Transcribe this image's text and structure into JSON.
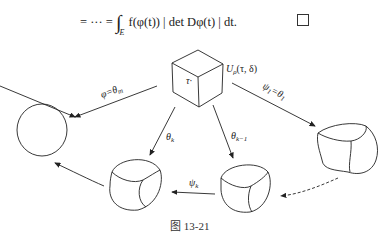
{
  "equation": {
    "lhs": "= ··· =",
    "integral_symbol": "∫",
    "integral_subscript": "E",
    "integrand": "f(φ(t)) | det Dφ(t) | dt.",
    "qed_symbol": "□"
  },
  "figure": {
    "caption": "图 13-21",
    "labels": {
      "neighborhood": "U_ρ(τ, δ)",
      "center_point": "τ·",
      "arrow_phi": "φ=θ_m",
      "arrow_theta_k": "θ_k",
      "arrow_theta_k_minus_1": "θ_{k-1}",
      "arrow_psi_1": "ψ_1=θ_1",
      "arrow_psi_k": "ψ_k"
    }
  }
}
